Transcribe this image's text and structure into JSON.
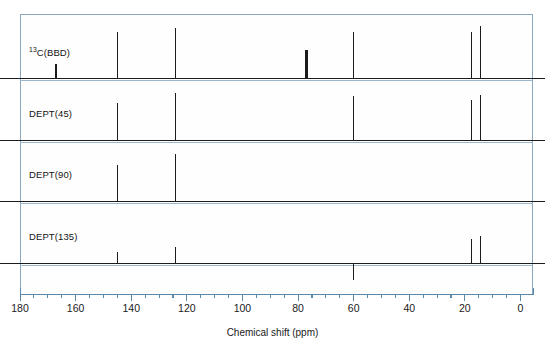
{
  "figure": {
    "axis_title": "Chemical shift (ppm)",
    "frame_color": "#8aa8c0",
    "trace_color": "#1c1c1c",
    "axis_color": "#5b89ac"
  },
  "chart_data": {
    "type": "line",
    "title": "",
    "xlabel": "Chemical shift (ppm)",
    "ylabel": "",
    "xlim": [
      180,
      0
    ],
    "x_reversed": true,
    "grid": false,
    "legend": "none",
    "tick_labels": [
      "180",
      "160",
      "140",
      "120",
      "100",
      "80",
      "60",
      "40",
      "20",
      "0"
    ],
    "tick_values": [
      180,
      160,
      140,
      120,
      100,
      80,
      60,
      40,
      20,
      0
    ],
    "minor_tick_step": 5,
    "panels": [
      {
        "label": "13C(BBD)",
        "label_prefix_sup": "13",
        "label_rest": "C(BBD)",
        "peaks": [
          {
            "shift": 167.0,
            "height": 0.3,
            "direction": "up",
            "wide": false
          },
          {
            "shift": 145.0,
            "height": 1.0,
            "direction": "up",
            "wide": false
          },
          {
            "shift": 124.0,
            "height": 1.08,
            "direction": "up",
            "wide": false
          },
          {
            "shift": 77.0,
            "height": 0.6,
            "direction": "up",
            "wide": true
          },
          {
            "shift": 60.0,
            "height": 1.0,
            "direction": "up",
            "wide": false
          },
          {
            "shift": 17.5,
            "height": 1.0,
            "direction": "up",
            "wide": false
          },
          {
            "shift": 14.5,
            "height": 1.12,
            "direction": "up",
            "wide": false
          }
        ]
      },
      {
        "label": "DEPT(45)",
        "peaks": [
          {
            "shift": 145.0,
            "height": 0.84,
            "direction": "up",
            "wide": false
          },
          {
            "shift": 124.0,
            "height": 1.06,
            "direction": "up",
            "wide": false
          },
          {
            "shift": 60.0,
            "height": 1.0,
            "direction": "up",
            "wide": false
          },
          {
            "shift": 17.5,
            "height": 0.9,
            "direction": "up",
            "wide": false
          },
          {
            "shift": 14.5,
            "height": 1.02,
            "direction": "up",
            "wide": false
          }
        ]
      },
      {
        "label": "DEPT(90)",
        "peaks": [
          {
            "shift": 145.0,
            "height": 0.82,
            "direction": "up",
            "wide": false
          },
          {
            "shift": 124.0,
            "height": 1.06,
            "direction": "up",
            "wide": false
          }
        ]
      },
      {
        "label": "DEPT(135)",
        "peaks": [
          {
            "shift": 145.0,
            "height": 0.38,
            "direction": "up",
            "wide": false
          },
          {
            "shift": 124.0,
            "height": 0.56,
            "direction": "up",
            "wide": false
          },
          {
            "shift": 60.0,
            "height": 0.62,
            "direction": "down",
            "wide": false
          },
          {
            "shift": 17.5,
            "height": 0.85,
            "direction": "up",
            "wide": false
          },
          {
            "shift": 14.5,
            "height": 0.96,
            "direction": "up",
            "wide": false
          }
        ]
      }
    ]
  }
}
